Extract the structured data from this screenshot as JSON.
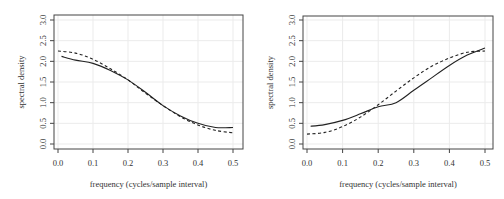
{
  "chart_data": [
    {
      "type": "line",
      "title": "",
      "xlabel": "frequency (cycles/sample interval)",
      "ylabel": "spectral density",
      "xlim": [
        0,
        0.5
      ],
      "ylim": [
        0,
        3.0
      ],
      "xticks": [
        "0.0",
        "0.1",
        "0.2",
        "0.3",
        "0.4",
        "0.5"
      ],
      "yticks": [
        "0.0",
        "0.5",
        "1.0",
        "1.5",
        "2.0",
        "2.5",
        "3.0"
      ],
      "grid": true,
      "legend": null,
      "series": [
        {
          "name": "solid",
          "style": "solid",
          "x": [
            0.01,
            0.05,
            0.1,
            0.15,
            0.2,
            0.25,
            0.3,
            0.35,
            0.4,
            0.45,
            0.5
          ],
          "values": [
            2.12,
            2.03,
            1.95,
            1.78,
            1.55,
            1.25,
            0.93,
            0.68,
            0.5,
            0.4,
            0.4
          ]
        },
        {
          "name": "dashed",
          "style": "dashed",
          "x": [
            0.0,
            0.05,
            0.1,
            0.15,
            0.2,
            0.25,
            0.3,
            0.35,
            0.4,
            0.45,
            0.5
          ],
          "values": [
            2.25,
            2.2,
            2.05,
            1.82,
            1.55,
            1.23,
            0.93,
            0.66,
            0.46,
            0.33,
            0.27
          ]
        }
      ]
    },
    {
      "type": "line",
      "title": "",
      "xlabel": "frequency (cycles/sample interval)",
      "ylabel": "spectral density",
      "xlim": [
        0,
        0.5
      ],
      "ylim": [
        0,
        3.0
      ],
      "xticks": [
        "0.0",
        "0.1",
        "0.2",
        "0.3",
        "0.4",
        "0.5"
      ],
      "yticks": [
        "0.0",
        "0.5",
        "1.0",
        "1.5",
        "2.0",
        "2.5",
        "3.0"
      ],
      "grid": true,
      "legend": null,
      "series": [
        {
          "name": "solid",
          "style": "solid",
          "x": [
            0.01,
            0.05,
            0.1,
            0.15,
            0.2,
            0.25,
            0.3,
            0.35,
            0.4,
            0.45,
            0.5
          ],
          "values": [
            0.43,
            0.47,
            0.57,
            0.73,
            0.9,
            1.0,
            1.3,
            1.6,
            1.9,
            2.15,
            2.32
          ]
        },
        {
          "name": "dashed",
          "style": "dashed",
          "x": [
            0.0,
            0.05,
            0.1,
            0.15,
            0.2,
            0.25,
            0.3,
            0.35,
            0.4,
            0.45,
            0.5
          ],
          "values": [
            0.24,
            0.28,
            0.42,
            0.65,
            0.95,
            1.28,
            1.6,
            1.88,
            2.08,
            2.22,
            2.25
          ]
        }
      ]
    }
  ],
  "colors": {
    "line": "#222222",
    "axis": "#444444",
    "grid": "#ebebeb",
    "text": "#333333"
  }
}
